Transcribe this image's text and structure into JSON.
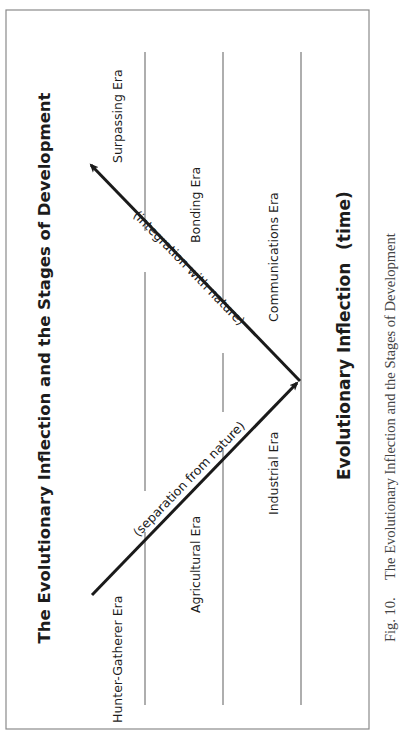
{
  "figure": {
    "title": "The Evolutionary Inflection and the Stages of Development",
    "footer_label": "Evolutionary Inflection",
    "footer_axis": "(time)",
    "caption_number": "Fig. 10.",
    "caption_text": "The Evolutionary Inflection and the Stages of Development",
    "caption_second_line_faint": "",
    "eras": [
      {
        "label": "Hunter-Gatherer Era"
      },
      {
        "label": "Agricultural Era"
      },
      {
        "label": "Industrial Era"
      },
      {
        "label": "Surpassing Era"
      },
      {
        "label": "Bonding Era"
      },
      {
        "label": "Communications Era"
      }
    ],
    "arrows": [
      {
        "label": "(separation from nature)",
        "direction": "toward inflection point"
      },
      {
        "label": "(integration with nature)",
        "direction": "away from inflection point"
      }
    ],
    "colors": {
      "frame": "#8a8a8a",
      "divider": "#9a9a9a",
      "arrow": "#1a1a1a",
      "text": "#1c1c1c",
      "caption": "#444444"
    }
  }
}
